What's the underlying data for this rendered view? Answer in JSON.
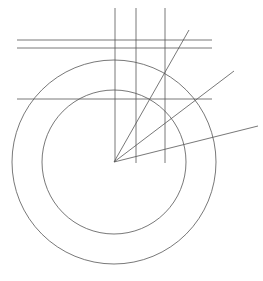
{
  "diagram": {
    "type": "geometric-construction",
    "stroke_color": "#555555",
    "background": "#ffffff",
    "center": {
      "x": 114,
      "y": 162
    },
    "circles": [
      {
        "name": "outer-circle",
        "r": 102
      },
      {
        "name": "inner-circle",
        "r": 72
      }
    ],
    "vertical_lines": [
      {
        "x": 115,
        "y1": 8,
        "y2": 162
      },
      {
        "x": 136,
        "y1": 8,
        "y2": 163
      },
      {
        "x": 165,
        "y1": 8,
        "y2": 163
      }
    ],
    "horizontal_lines": [
      {
        "y": 40,
        "x1": 17,
        "x2": 212
      },
      {
        "y": 48,
        "x1": 17,
        "x2": 212
      },
      {
        "y": 99,
        "x1": 17,
        "x2": 212
      }
    ],
    "rays": [
      {
        "x2": 189,
        "y2": 30
      },
      {
        "x2": 234,
        "y2": 71
      },
      {
        "x2": 258,
        "y2": 126
      }
    ]
  }
}
